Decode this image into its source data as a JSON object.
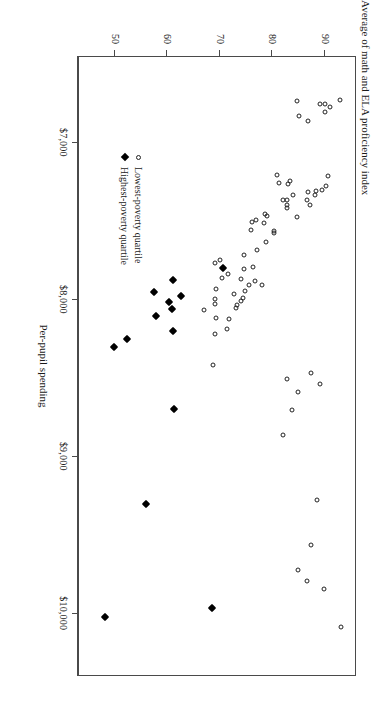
{
  "chart_data": {
    "type": "scatter",
    "title": "",
    "xlabel": "Per-pupil spending",
    "ylabel": "Average of math and ELA proficiency index",
    "xlim": [
      6450,
      10400
    ],
    "ylim": [
      43,
      96
    ],
    "grid": false,
    "legend_position": "bottom-left-inside",
    "x_ticks": [
      7000,
      8000,
      9000,
      10000
    ],
    "x_tick_labels": [
      "$7,000",
      "$8,000",
      "$9,000",
      "$10,000"
    ],
    "y_ticks": [
      90,
      80,
      70,
      60,
      50
    ],
    "y_tick_labels": [
      "90",
      "80",
      "70",
      "60",
      "50"
    ],
    "series": [
      {
        "name": "Lowest-poverty quartile",
        "marker": "open-circle",
        "color": "#222222",
        "points": [
          [
            6723,
            93.1
          ],
          [
            6767,
            91.3
          ],
          [
            6750,
            90.3
          ],
          [
            6800,
            90.3
          ],
          [
            6747,
            89.4
          ],
          [
            6860,
            87.0
          ],
          [
            6826,
            85.4
          ],
          [
            6731,
            84.9
          ],
          [
            7275,
            90.4
          ],
          [
            7330,
            88.4
          ],
          [
            7210,
            90.8
          ],
          [
            7296,
            89.7
          ],
          [
            7305,
            88.5
          ],
          [
            7311,
            87.1
          ],
          [
            7362,
            86.8
          ],
          [
            7395,
            87.5
          ],
          [
            7470,
            85.0
          ],
          [
            7330,
            84.2
          ],
          [
            7243,
            83.6
          ],
          [
            7262,
            83.3
          ],
          [
            7358,
            83.1
          ],
          [
            7392,
            83.0
          ],
          [
            7410,
            83.0
          ],
          [
            7363,
            82.2
          ],
          [
            7200,
            81.2
          ],
          [
            7255,
            81.5
          ],
          [
            7560,
            80.5
          ],
          [
            7570,
            80.5
          ],
          [
            7460,
            79.3
          ],
          [
            7450,
            78.9
          ],
          [
            7505,
            78.6
          ],
          [
            7629,
            79.0
          ],
          [
            7487,
            77.1
          ],
          [
            7503,
            76.4
          ],
          [
            7552,
            76.2
          ],
          [
            7680,
            77.3
          ],
          [
            7790,
            76.6
          ],
          [
            7710,
            74.9
          ],
          [
            7800,
            74.8
          ],
          [
            7905,
            78.2
          ],
          [
            7878,
            76.9
          ],
          [
            7900,
            75.8
          ],
          [
            7862,
            74.3
          ],
          [
            7942,
            75.0
          ],
          [
            7986,
            74.6
          ],
          [
            8005,
            74.3
          ],
          [
            7960,
            73.0
          ],
          [
            8030,
            73.5
          ],
          [
            8050,
            73.4
          ],
          [
            7831,
            71.8
          ],
          [
            7855,
            70.7
          ],
          [
            8120,
            72.0
          ],
          [
            8180,
            71.6
          ],
          [
            7745,
            70.2
          ],
          [
            7763,
            69.3
          ],
          [
            7930,
            69.5
          ],
          [
            7990,
            69.4
          ],
          [
            8022,
            69.4
          ],
          [
            8110,
            69.5
          ],
          [
            8212,
            69.4
          ],
          [
            8415,
            68.9
          ],
          [
            8060,
            67.3
          ],
          [
            8536,
            89.3
          ],
          [
            8462,
            87.6
          ],
          [
            8585,
            85.2
          ],
          [
            8500,
            83.1
          ],
          [
            8700,
            84.0
          ],
          [
            8860,
            82.3
          ],
          [
            9270,
            88.8
          ],
          [
            9560,
            87.6
          ],
          [
            9720,
            85.1
          ],
          [
            9790,
            86.8
          ],
          [
            9840,
            90.0
          ],
          [
            10080,
            93.4
          ]
        ]
      },
      {
        "name": "Highest-poverty quartile",
        "marker": "filled-diamond",
        "color": "#000000",
        "points": [
          [
            7795,
            70.8
          ],
          [
            7870,
            61.3
          ],
          [
            7945,
            57.6
          ],
          [
            7975,
            62.8
          ],
          [
            8010,
            60.5
          ],
          [
            8055,
            61.2
          ],
          [
            8100,
            58.1
          ],
          [
            8195,
            61.3
          ],
          [
            8245,
            52.5
          ],
          [
            8300,
            50.0
          ],
          [
            8690,
            61.5
          ],
          [
            9300,
            56.2
          ],
          [
            9960,
            68.8
          ],
          [
            10020,
            48.4
          ]
        ]
      }
    ]
  },
  "axis": {
    "x_title": "Per-pupil spending",
    "y_title": "Average of math and ELA proficiency index"
  },
  "legend": {
    "entries": [
      {
        "label": "Lowest-poverty quartile",
        "marker": "open-circle"
      },
      {
        "label": "Highest-poverty quartile",
        "marker": "filled-diamond"
      }
    ]
  }
}
